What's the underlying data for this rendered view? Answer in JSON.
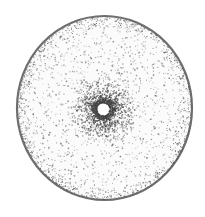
{
  "image": {
    "width": 205,
    "height": 217,
    "background": "#ffffff",
    "subject": "stippled drawing of a circular disc with radial dark center and central hole"
  },
  "disc": {
    "cx": 104.5,
    "cy": 108,
    "rx": 88.5,
    "ry": 93,
    "rim_color": "#555555",
    "rim_width": 2.2,
    "fill": "#fbfbfb"
  },
  "center_burst": {
    "cx": 103,
    "cy": 109,
    "radius": 26,
    "rays": 18,
    "color": "#3a3a3a"
  },
  "hole": {
    "cx": 103,
    "cy": 109,
    "r": 5.5,
    "fill": "#ffffff"
  },
  "stipple": {
    "field_dots": 1400,
    "rim_dots": 900,
    "burst_dots": 1300,
    "dot_color": "#444444",
    "seed": 7
  }
}
